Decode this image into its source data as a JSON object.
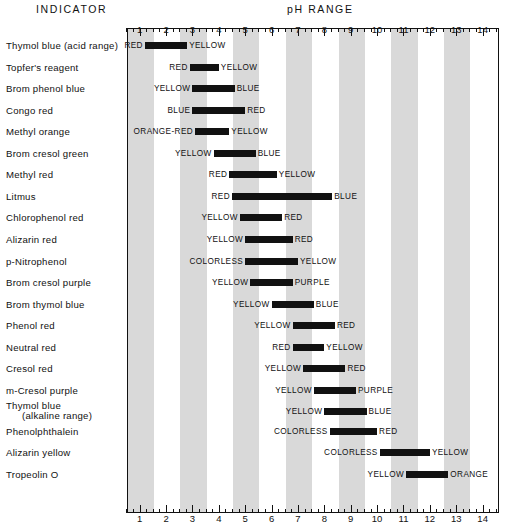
{
  "header": {
    "indicator_title": "INDICATOR",
    "ph_title": "pH RANGE"
  },
  "axis": {
    "min": 0.52,
    "max": 14.62,
    "tick_labels": [
      "1",
      "2",
      "3",
      "4",
      "5",
      "6",
      "7",
      "8",
      "9",
      "10",
      "11",
      "12",
      "13",
      "14"
    ],
    "tick_values": [
      1,
      2,
      3,
      4,
      5,
      6,
      7,
      8,
      9,
      10,
      11,
      12,
      13,
      14
    ],
    "minor_step": 0.25,
    "stripe_color": "#d9d9d9",
    "bar_color": "#111111",
    "shaded_units": [
      1,
      3,
      5,
      7,
      9,
      11,
      13
    ]
  },
  "chart_data": {
    "type": "bar",
    "title": "pH RANGE",
    "xlabel": "pH RANGE",
    "ylabel": "INDICATOR",
    "xlim": [
      0.52,
      14.62
    ],
    "grid": true,
    "legend": "none",
    "categories": [
      "Thymol blue (acid range)",
      "Topfer's reagent",
      "Brom phenol blue",
      "Congo red",
      "Methyl orange",
      "Brom cresol green",
      "Methyl red",
      "Litmus",
      "Chlorophenol red",
      "Alizarin red",
      "p-Nitrophenol",
      "Brom cresol purple",
      "Brom thymol blue",
      "Phenol red",
      "Neutral red",
      "Cresol red",
      "m-Cresol purple",
      "Thymol blue (alkaline range)",
      "Phenolphthalein",
      "Alizarin yellow",
      "Tropeolin O"
    ],
    "rows": [
      {
        "name": "Thymol blue (acid range)",
        "label_line1": "Thymol blue (acid range)",
        "label_line2": "",
        "acid_color": "RED",
        "base_color": "YELLOW",
        "start": 1.2,
        "end": 2.8
      },
      {
        "name": "Topfer's reagent",
        "label_line1": "Topfer's reagent",
        "label_line2": "",
        "acid_color": "RED",
        "base_color": "YELLOW",
        "start": 2.9,
        "end": 4.0
      },
      {
        "name": "Brom phenol blue",
        "label_line1": "Brom phenol blue",
        "label_line2": "",
        "acid_color": "YELLOW",
        "base_color": "BLUE",
        "start": 3.0,
        "end": 4.6
      },
      {
        "name": "Congo red",
        "label_line1": "Congo red",
        "label_line2": "",
        "acid_color": "BLUE",
        "base_color": "RED",
        "start": 3.0,
        "end": 5.0
      },
      {
        "name": "Methyl orange",
        "label_line1": "Methyl orange",
        "label_line2": "",
        "acid_color": "ORANGE-RED",
        "base_color": "YELLOW",
        "start": 3.1,
        "end": 4.4
      },
      {
        "name": "Brom cresol green",
        "label_line1": "Brom cresol green",
        "label_line2": "",
        "acid_color": "YELLOW",
        "base_color": "BLUE",
        "start": 3.8,
        "end": 5.4
      },
      {
        "name": "Methyl red",
        "label_line1": "Methyl red",
        "label_line2": "",
        "acid_color": "RED",
        "base_color": "YELLOW",
        "start": 4.4,
        "end": 6.2
      },
      {
        "name": "Litmus",
        "label_line1": "Litmus",
        "label_line2": "",
        "acid_color": "RED",
        "base_color": "BLUE",
        "start": 4.5,
        "end": 8.3
      },
      {
        "name": "Chlorophenol red",
        "label_line1": "Chlorophenol red",
        "label_line2": "",
        "acid_color": "YELLOW",
        "base_color": "RED",
        "start": 4.8,
        "end": 6.4
      },
      {
        "name": "Alizarin red",
        "label_line1": "Alizarin red",
        "label_line2": "",
        "acid_color": "YELLOW",
        "base_color": "RED",
        "start": 5.0,
        "end": 6.8
      },
      {
        "name": "p-Nitrophenol",
        "label_line1": "p-Nitrophenol",
        "label_line2": "",
        "acid_color": "COLORLESS",
        "base_color": "YELLOW",
        "start": 5.0,
        "end": 7.0
      },
      {
        "name": "Brom cresol purple",
        "label_line1": "Brom cresol purple",
        "label_line2": "",
        "acid_color": "YELLOW",
        "base_color": "PURPLE",
        "start": 5.2,
        "end": 6.8
      },
      {
        "name": "Brom thymol blue",
        "label_line1": "Brom thymol blue",
        "label_line2": "",
        "acid_color": "YELLOW",
        "base_color": "BLUE",
        "start": 6.0,
        "end": 7.6
      },
      {
        "name": "Phenol red",
        "label_line1": "Phenol red",
        "label_line2": "",
        "acid_color": "YELLOW",
        "base_color": "RED",
        "start": 6.8,
        "end": 8.4
      },
      {
        "name": "Neutral red",
        "label_line1": "Neutral red",
        "label_line2": "",
        "acid_color": "RED",
        "base_color": "YELLOW",
        "start": 6.8,
        "end": 8.0
      },
      {
        "name": "Cresol red",
        "label_line1": "Cresol red",
        "label_line2": "",
        "acid_color": "YELLOW",
        "base_color": "RED",
        "start": 7.2,
        "end": 8.8
      },
      {
        "name": "m-Cresol purple",
        "label_line1": "m-Cresol purple",
        "label_line2": "",
        "acid_color": "YELLOW",
        "base_color": "PURPLE",
        "start": 7.6,
        "end": 9.2
      },
      {
        "name": "Thymol blue (alkaline range)",
        "label_line1": "Thymol blue",
        "label_line2": "(alkaline range)",
        "acid_color": "YELLOW",
        "base_color": "BLUE",
        "start": 8.0,
        "end": 9.6
      },
      {
        "name": "Phenolphthalein",
        "label_line1": "Phenolphthalein",
        "label_line2": "",
        "acid_color": "COLORLESS",
        "base_color": "RED",
        "start": 8.2,
        "end": 10.0
      },
      {
        "name": "Alizarin yellow",
        "label_line1": "Alizarin yellow",
        "label_line2": "",
        "acid_color": "COLORLESS",
        "base_color": "YELLOW",
        "start": 10.1,
        "end": 12.0
      },
      {
        "name": "Tropeolin O",
        "label_line1": "Tropeolin O",
        "label_line2": "",
        "acid_color": "YELLOW",
        "base_color": "ORANGE",
        "start": 11.1,
        "end": 12.7
      }
    ]
  }
}
